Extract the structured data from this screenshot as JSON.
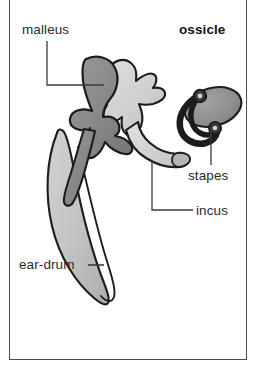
{
  "figure": {
    "title": "ossicle",
    "frame": {
      "border_color": "#4a4a4a",
      "background": "#ffffff"
    },
    "labels": {
      "malleus": "malleus",
      "ossicle": "ossicle",
      "stapes": "stapes",
      "incus": "incus",
      "eardrum": "ear-drum"
    },
    "colors": {
      "malleus_fill": "#8a8a8a",
      "incus_fill": "#d2d2d2",
      "stapes_fill": "#8f8f8f",
      "eardrum_fill": "#c3c3c3",
      "outline": "#1c1c1c",
      "leader_line": "#3a3a3a",
      "text": "#2b2b2b"
    },
    "parts": [
      {
        "name": "malleus",
        "label": "malleus",
        "description": "hammer-shaped ossicle, dark gray, upper left of the chain",
        "fill": "#8a8a8a"
      },
      {
        "name": "incus",
        "label": "incus",
        "description": "anvil-shaped ossicle, light gray, center, long process curving right toward stapes",
        "fill": "#d2d2d2"
      },
      {
        "name": "stapes",
        "label": "stapes",
        "description": "stirrup-shaped ossicle with oval footplate, upper right",
        "fill": "#8f8f8f"
      },
      {
        "name": "ear-drum",
        "label": "ear-drum",
        "description": "tympanic membrane, light gray elongated blade sweeping down-left",
        "fill": "#c3c3c3"
      }
    ],
    "leader_lines": [
      {
        "name": "malleus-leader",
        "from": "malleus label",
        "to": "malleus body"
      },
      {
        "name": "stapes-leader",
        "from": "stapes label",
        "to": "stapes footplate"
      },
      {
        "name": "incus-leader",
        "from": "incus label",
        "to": "incus long process"
      },
      {
        "name": "eardrum-leader",
        "from": "ear-drum label",
        "to": "ear-drum membrane"
      }
    ]
  }
}
